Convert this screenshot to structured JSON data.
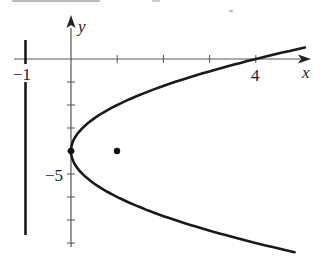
{
  "chart_data": {
    "type": "line",
    "title": "",
    "xlabel": "x",
    "ylabel": "y",
    "xlim": [
      -1.2,
      5.2
    ],
    "ylim": [
      -8.5,
      1.0
    ],
    "grid": false,
    "x_tick_labels": [
      {
        "value": -1,
        "label": "−1"
      },
      {
        "value": 4,
        "label": "4"
      }
    ],
    "y_tick_labels": [
      {
        "value": -5,
        "label": "−5"
      }
    ],
    "x_ticks": [
      1,
      2,
      3,
      4
    ],
    "y_ticks": [
      -1,
      -2,
      -3,
      -4,
      -5,
      -6,
      -7,
      -8
    ],
    "series": [
      {
        "name": "parabola",
        "equation": "x = (y + 4)^2 / 4",
        "vertex": [
          0,
          -4
        ],
        "y_range": [
          -8.4,
          0.5
        ]
      },
      {
        "name": "directrix",
        "equation": "x = -1",
        "y_range": [
          -7.6,
          0.8
        ]
      }
    ],
    "points": [
      {
        "name": "vertex",
        "x": 0,
        "y": -4
      },
      {
        "name": "focus",
        "x": 1,
        "y": -4
      }
    ]
  },
  "labels": {
    "x_axis": "x",
    "y_axis": "y",
    "minus_one": "−1",
    "four": "4",
    "minus_five": "−5"
  },
  "colors": {
    "curve": "#1a1a1a",
    "axis": "#555555"
  }
}
